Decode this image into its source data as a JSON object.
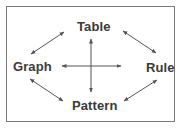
{
  "diagram": {
    "nodes": [
      {
        "id": "table",
        "label": "Table",
        "position": "top"
      },
      {
        "id": "graph",
        "label": "Graph",
        "position": "left"
      },
      {
        "id": "rule",
        "label": "Rule",
        "position": "right"
      },
      {
        "id": "pattern",
        "label": "Pattern",
        "position": "bottom"
      }
    ],
    "edges": [
      {
        "from": "graph",
        "to": "table",
        "type": "bidirectional"
      },
      {
        "from": "table",
        "to": "rule",
        "type": "bidirectional"
      },
      {
        "from": "graph",
        "to": "pattern",
        "type": "bidirectional"
      },
      {
        "from": "pattern",
        "to": "rule",
        "type": "bidirectional"
      },
      {
        "from": "table",
        "to": "pattern",
        "type": "bidirectional"
      },
      {
        "from": "graph",
        "to": "rule",
        "type": "bidirectional"
      }
    ],
    "colors": {
      "text": "#3a3a3a",
      "arrow": "#555555",
      "border": "#7a7a7a",
      "background": "#ffffff"
    }
  }
}
